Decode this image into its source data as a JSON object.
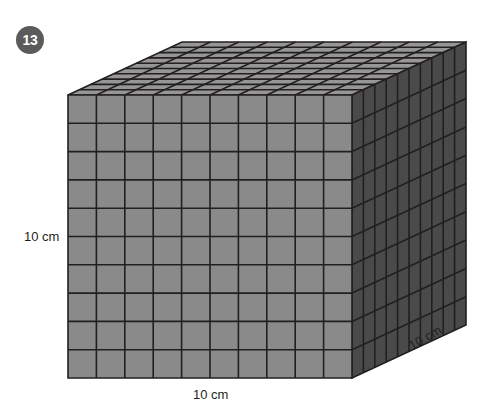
{
  "page": {
    "background_color": "#ffffff",
    "width": 491,
    "height": 415
  },
  "question": {
    "number": "13",
    "badge_fill": "#5b5b5b",
    "badge_text_color": "#ffffff"
  },
  "figure": {
    "name": "unit-cube-block-10x10x10",
    "faces": {
      "front": {
        "fill": "#8a8a8a",
        "rows": 10,
        "cols": 10
      },
      "top": {
        "fill": "#969696",
        "rows": 10,
        "cols": 10
      },
      "right": {
        "fill": "#4a4a4a",
        "rows": 10,
        "cols": 10
      }
    },
    "stroke_color": "#231f20",
    "geometry": {
      "front_left": 68,
      "front_top": 95,
      "front_right": 352,
      "front_bottom": 378,
      "depth_dx": 114,
      "depth_dy": -53
    }
  },
  "labels": {
    "height": "10 cm",
    "width": "10 cm",
    "depth": "10 cm",
    "text_color": "#231f20"
  },
  "chart_data": {
    "type": "diagram",
    "title": "",
    "shape": "rectangular prism (cube)",
    "units": "cm",
    "dimensions": {
      "width": 10,
      "height": 10,
      "depth": 10
    },
    "unit_cubes_per_edge": 10,
    "total_unit_cubes": 1000,
    "annotations": [
      "10 cm",
      "10 cm",
      "10 cm"
    ]
  }
}
